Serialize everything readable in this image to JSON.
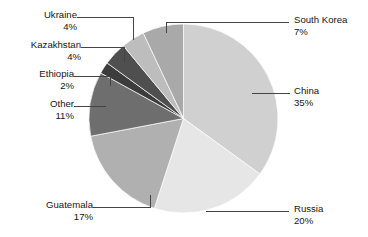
{
  "chart_data": {
    "type": "pie",
    "title": "",
    "subtitle": "",
    "xlabel": "",
    "ylabel": "",
    "grid": false,
    "legend_position": "none",
    "labels_position": "outside-with-leader-lines",
    "start_angle_deg": 0,
    "direction": "clockwise",
    "total_percent": 100,
    "categories": [
      "China",
      "Russia",
      "Guatemala",
      "Other",
      "Ethiopia",
      "Kazakhstan",
      "Ukraine",
      "South Korea"
    ],
    "values": [
      35,
      20,
      17,
      11,
      2,
      4,
      4,
      7
    ],
    "slices": [
      {
        "name": "China",
        "percent": 35,
        "percent_label": "35%",
        "color": "#d0d0d0"
      },
      {
        "name": "Russia",
        "percent": 20,
        "percent_label": "20%",
        "color": "#e6e6e6"
      },
      {
        "name": "Guatemala",
        "percent": 17,
        "percent_label": "17%",
        "color": "#b0b0b0"
      },
      {
        "name": "Other",
        "percent": 11,
        "percent_label": "11%",
        "color": "#6e6e6e"
      },
      {
        "name": "Ethiopia",
        "percent": 2,
        "percent_label": "2%",
        "color": "#3c3c3c"
      },
      {
        "name": "Kazakhstan",
        "percent": 4,
        "percent_label": "4%",
        "color": "#4f4f4f"
      },
      {
        "name": "Ukraine",
        "percent": 4,
        "percent_label": "4%",
        "color": "#bdbdbd"
      },
      {
        "name": "South Korea",
        "percent": 7,
        "percent_label": "7%",
        "color": "#a9a9a9"
      }
    ]
  },
  "labels": {
    "ukraine": {
      "name": "Ukraine",
      "percent": "4%"
    },
    "kazakhstan": {
      "name": "Kazakhstan",
      "percent": "4%"
    },
    "ethiopia": {
      "name": "Ethiopia",
      "percent": "2%"
    },
    "other": {
      "name": "Other",
      "percent": "11%"
    },
    "guatemala": {
      "name": "Guatemala",
      "percent": "17%"
    },
    "south_korea": {
      "name": "South Korea",
      "percent": "7%"
    },
    "china": {
      "name": "China",
      "percent": "35%"
    },
    "russia": {
      "name": "Russia",
      "percent": "20%"
    }
  },
  "colors": {
    "background": "#ffffff",
    "text": "#161616",
    "leader_line": "#444444"
  }
}
